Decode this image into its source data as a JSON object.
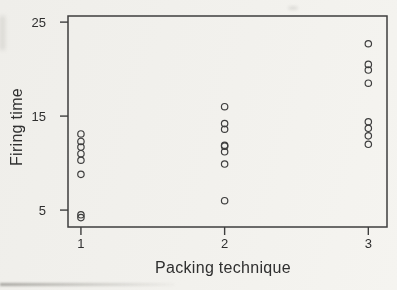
{
  "figure": {
    "background_color": "#f1f0ec",
    "ink_color": "#3e3e3e",
    "text_color": "#2f2f2f"
  },
  "chart_data": {
    "type": "scatter",
    "title": "",
    "xlabel": "Packing technique",
    "ylabel": "Firing time",
    "marker": "open-circle",
    "grid": false,
    "legend": false,
    "x_ticks": [
      1,
      2,
      3
    ],
    "y_ticks": [
      5,
      15,
      25
    ],
    "xlim": [
      0.91,
      3.13
    ],
    "ylim": [
      3.2,
      25.65
    ],
    "series": [
      {
        "name": "packing-technique-1",
        "x": 1,
        "firing_times": [
          13.1,
          12.3,
          11.7,
          11.0,
          10.3,
          8.8,
          4.5,
          4.2
        ]
      },
      {
        "name": "packing-technique-2",
        "x": 2,
        "firing_times": [
          16.0,
          14.2,
          13.6,
          11.9,
          11.8,
          11.2,
          9.9,
          6.0
        ]
      },
      {
        "name": "packing-technique-3",
        "x": 3,
        "firing_times": [
          22.7,
          20.5,
          19.9,
          18.5,
          14.4,
          13.7,
          12.9,
          12.0
        ]
      }
    ]
  }
}
